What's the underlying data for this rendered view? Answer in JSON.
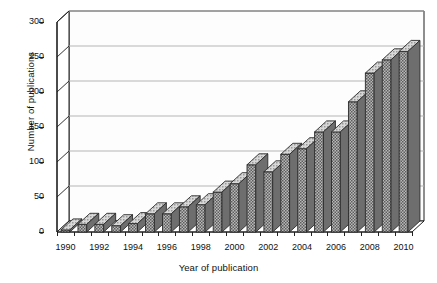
{
  "chart_data": {
    "type": "bar",
    "title": "",
    "xlabel": "Year of publication",
    "ylabel": "Number of publications",
    "categories": [
      1990,
      1991,
      1992,
      1993,
      1994,
      1995,
      1996,
      1997,
      1998,
      1999,
      2000,
      2001,
      2002,
      2003,
      2004,
      2005,
      2006,
      2007,
      2008,
      2009,
      2010
    ],
    "values": [
      3,
      11,
      11,
      9,
      12,
      26,
      26,
      36,
      39,
      57,
      69,
      96,
      86,
      111,
      119,
      143,
      143,
      186,
      227,
      246,
      258
    ],
    "xlim": [
      1989.5,
      2010.5
    ],
    "ylim": [
      0,
      300
    ],
    "yticks": [
      0,
      50,
      100,
      150,
      200,
      250,
      300
    ],
    "ytick_labels": [
      "0",
      "50",
      "100",
      "150",
      "200",
      "250",
      "300"
    ],
    "xticks": [
      1990,
      1992,
      1994,
      1996,
      1998,
      2000,
      2002,
      2004,
      2006,
      2008,
      2010
    ],
    "xtick_labels": [
      "1990",
      "1992",
      "1994",
      "1996",
      "1998",
      "2000",
      "2002",
      "2004",
      "2006",
      "2008",
      "2010"
    ],
    "grid": true,
    "grid_axis": "y",
    "legend": false,
    "style": "3d-bars",
    "colors": {
      "bar_face": "#8c8c8c",
      "bar_top": "#bdbdbd",
      "bar_side": "#6e6e6e",
      "bar_edge": "#2b2b2b",
      "grid": "#b5b5b5",
      "axis": "#1f1f1f",
      "background": "#ffffff",
      "wall": "#fdfdfd"
    }
  }
}
